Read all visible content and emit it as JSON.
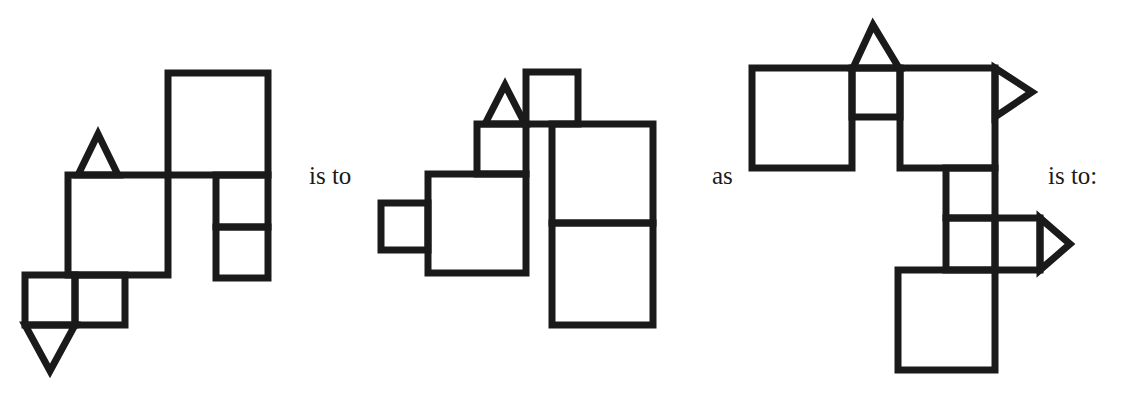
{
  "page": {
    "width": 1128,
    "height": 399,
    "background": "#ffffff",
    "stroke_color": "#1a1a1a",
    "stroke_width": 7,
    "type": "visual-analogy-puzzle"
  },
  "connectors": {
    "is_to_1": "is to",
    "as": "as",
    "is_to_2": "is to:"
  },
  "figures": [
    {
      "id": "figure-a",
      "role": "analogy-term-A",
      "shapes": [
        {
          "name": "large-square-top-right",
          "type": "rect",
          "x": 168,
          "y": 73,
          "w": 100,
          "h": 102
        },
        {
          "name": "small-square-right-upper",
          "type": "rect",
          "x": 216,
          "y": 175,
          "w": 52,
          "h": 52
        },
        {
          "name": "small-square-right-lower",
          "type": "rect",
          "x": 216,
          "y": 227,
          "w": 52,
          "h": 51
        },
        {
          "name": "large-square-middle",
          "type": "rect",
          "x": 68,
          "y": 175,
          "w": 100,
          "h": 100
        },
        {
          "name": "triangle-up-on-middle-square",
          "type": "triangle",
          "points": "78,175 98,134 118,175"
        },
        {
          "name": "small-square-bottom-left",
          "type": "rect",
          "x": 25,
          "y": 275,
          "w": 50,
          "h": 50
        },
        {
          "name": "small-square-bottom-right",
          "type": "rect",
          "x": 75,
          "y": 275,
          "w": 50,
          "h": 50
        },
        {
          "name": "triangle-down-bottom",
          "type": "triangle",
          "points": "25,325 75,325 50,371"
        }
      ]
    },
    {
      "id": "figure-b",
      "role": "analogy-term-B",
      "shapes": [
        {
          "name": "small-square-top",
          "type": "rect",
          "x": 526,
          "y": 72,
          "w": 52,
          "h": 52
        },
        {
          "name": "triangle-up-left-of-top-square",
          "type": "triangle",
          "points": "485,124 505,85 525,124"
        },
        {
          "name": "small-square-under-triangle",
          "type": "rect",
          "x": 477,
          "y": 124,
          "w": 49,
          "h": 50
        },
        {
          "name": "large-square-left",
          "type": "rect",
          "x": 428,
          "y": 174,
          "w": 98,
          "h": 99
        },
        {
          "name": "small-square-far-left",
          "type": "rect",
          "x": 381,
          "y": 203,
          "w": 47,
          "h": 47
        },
        {
          "name": "large-square-right-upper",
          "type": "rect",
          "x": 552,
          "y": 124,
          "w": 101,
          "h": 99
        },
        {
          "name": "large-square-right-lower",
          "type": "rect",
          "x": 552,
          "y": 223,
          "w": 101,
          "h": 102
        }
      ]
    },
    {
      "id": "figure-c",
      "role": "analogy-term-C",
      "shapes": [
        {
          "name": "large-square-top-left",
          "type": "rect",
          "x": 752,
          "y": 68,
          "w": 100,
          "h": 100
        },
        {
          "name": "small-square-top-middle",
          "type": "rect",
          "x": 852,
          "y": 68,
          "w": 48,
          "h": 49
        },
        {
          "name": "triangle-up-on-small-square",
          "type": "triangle",
          "points": "853,68 873,25 899,68"
        },
        {
          "name": "large-square-top-right",
          "type": "rect",
          "x": 900,
          "y": 68,
          "w": 95,
          "h": 100
        },
        {
          "name": "triangle-right-pointing-upper",
          "type": "triangle",
          "points": "995,68 1032,92 995,117"
        },
        {
          "name": "small-square-column-upper",
          "type": "rect",
          "x": 946,
          "y": 168,
          "w": 49,
          "h": 50
        },
        {
          "name": "small-square-column-lower",
          "type": "rect",
          "x": 946,
          "y": 218,
          "w": 49,
          "h": 52
        },
        {
          "name": "small-square-right-of-column",
          "type": "rect",
          "x": 995,
          "y": 218,
          "w": 45,
          "h": 52
        },
        {
          "name": "triangle-right-pointing-lower",
          "type": "triangle",
          "points": "1040,218 1070,244 1040,270"
        },
        {
          "name": "large-square-bottom",
          "type": "rect",
          "x": 898,
          "y": 270,
          "w": 97,
          "h": 100
        }
      ]
    }
  ]
}
